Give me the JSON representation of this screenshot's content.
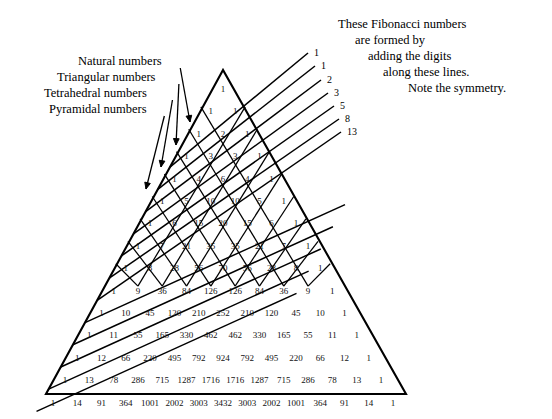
{
  "figure": {
    "title_hidden": "Pascal's Triangle with Fibonacci diagonals",
    "annotations": {
      "left_labels": [
        {
          "text": "Natural numbers",
          "x": 78,
          "y": 65,
          "tip_x": 190,
          "tip_y": 122
        },
        {
          "text": "Triangular numbers",
          "x": 57,
          "y": 81,
          "tip_x": 176,
          "tip_y": 145
        },
        {
          "text": "Tetrahedral numbers",
          "x": 44,
          "y": 97,
          "tip_x": 161,
          "tip_y": 167
        },
        {
          "text": "Pyramidal numbers",
          "x": 49,
          "y": 113,
          "tip_x": 146,
          "tip_y": 189
        }
      ],
      "note_lines": [
        {
          "text": "These Fibonacci numbers",
          "x": 338,
          "y": 28
        },
        {
          "text": "are formed by",
          "x": 355,
          "y": 44
        },
        {
          "text": "adding the digits",
          "x": 368,
          "y": 60
        },
        {
          "text": "along these lines.",
          "x": 383,
          "y": 76
        },
        {
          "text": "Note the symmetry.",
          "x": 408,
          "y": 92
        }
      ]
    },
    "fibonacci_labels": [
      {
        "value": "1",
        "x": 314,
        "y": 56
      },
      {
        "value": "1",
        "x": 321,
        "y": 69
      },
      {
        "value": "2",
        "x": 327,
        "y": 83
      },
      {
        "value": "3",
        "x": 334,
        "y": 96
      },
      {
        "value": "5",
        "x": 340,
        "y": 109
      },
      {
        "value": "8",
        "x": 345,
        "y": 122
      },
      {
        "value": "13",
        "x": 347,
        "y": 135
      }
    ]
  },
  "chart_data": {
    "type": "table",
    "xlabel": "",
    "ylabel": "",
    "grid": true,
    "legend": "none",
    "rows": [
      [
        1
      ],
      [
        1,
        1
      ],
      [
        1,
        2,
        1
      ],
      [
        1,
        3,
        3,
        1
      ],
      [
        1,
        4,
        6,
        4,
        1
      ],
      [
        1,
        5,
        10,
        10,
        5,
        1
      ],
      [
        1,
        6,
        15,
        20,
        15,
        6,
        1
      ],
      [
        1,
        7,
        21,
        35,
        35,
        21,
        7,
        1
      ],
      [
        1,
        8,
        28,
        56,
        70,
        56,
        28,
        8,
        1
      ],
      [
        1,
        9,
        36,
        84,
        126,
        126,
        84,
        36,
        9,
        1
      ],
      [
        1,
        10,
        45,
        120,
        210,
        252,
        210,
        120,
        45,
        10,
        1
      ],
      [
        1,
        11,
        55,
        165,
        330,
        462,
        462,
        330,
        165,
        55,
        11,
        1
      ],
      [
        1,
        12,
        66,
        220,
        495,
        792,
        924,
        792,
        495,
        220,
        66,
        12,
        1
      ],
      [
        1,
        13,
        78,
        286,
        715,
        1287,
        1716,
        1716,
        1287,
        715,
        286,
        78,
        13,
        1
      ],
      [
        1,
        14,
        91,
        364,
        1001,
        2002,
        3003,
        3432,
        3003,
        2002,
        1001,
        364,
        91,
        14,
        1
      ]
    ],
    "fibonacci_sequence": [
      1,
      1,
      2,
      3,
      5,
      8,
      13
    ],
    "diagonal_names": [
      "Natural numbers",
      "Triangular numbers",
      "Tetrahedral numbers",
      "Pyramidal numbers"
    ],
    "row_count": 15,
    "annotation_text": "These Fibonacci numbers are formed by adding the digits along these lines. Note the symmetry."
  },
  "colors": {
    "ink": "#000000",
    "paper": "#ffffff"
  }
}
